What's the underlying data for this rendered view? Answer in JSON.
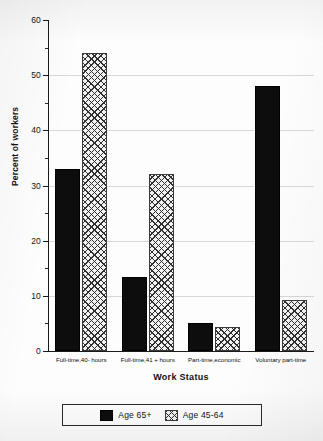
{
  "chart_data": {
    "type": "bar",
    "title": "",
    "xlabel": "Work Status",
    "ylabel": "Percent of workers",
    "ylim": [
      0,
      60
    ],
    "ytick_step": 10,
    "yminor_step": 5,
    "grid": true,
    "legend_position": "bottom",
    "categories": [
      "Full-time,40- hours",
      "Full-time,41 + hours",
      "Part-time,economic",
      "Voluntary part-time"
    ],
    "ytick_labels": [
      "0",
      "10",
      "20",
      "30",
      "40",
      "50",
      "60"
    ],
    "series": [
      {
        "name": "Age 65+",
        "pattern": "solid-black",
        "color": "#0d0d0d",
        "values": [
          33,
          13.5,
          5,
          48
        ]
      },
      {
        "name": "Age 45-64",
        "pattern": "crosshatch",
        "color": "#f2f2f2",
        "values": [
          54,
          32,
          4.3,
          9.3
        ]
      }
    ]
  },
  "legend": {
    "entries": [
      {
        "label": "Age 65+"
      },
      {
        "label": "Age 45-64"
      }
    ]
  }
}
